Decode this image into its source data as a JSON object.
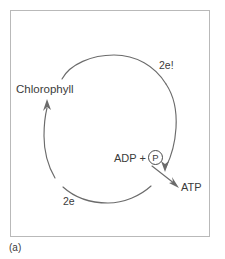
{
  "figure": {
    "caption": "(a)",
    "frame": {
      "border_color": "#b9b9b9",
      "background": "#ffffff"
    },
    "stroke_color": "#6b6b6b",
    "text_color": "#3b3b3b"
  },
  "diagram": {
    "type": "cyclic-photophosphorylation",
    "labels": {
      "chlorophyll": "Chlorophyll",
      "electrons_top": "2e!",
      "electrons_bottom": "2e",
      "adp": "ADP +",
      "phosphate": "P",
      "atp": "ATP"
    },
    "arcs": [
      {
        "name": "top-arc",
        "description": "arc from Chlorophyll upper area sweeping clockwise across the top"
      },
      {
        "name": "right-arc",
        "description": "arc descending on the right past ADP + P"
      },
      {
        "name": "bottom-arc",
        "description": "arc along the bottom flowing right to left"
      },
      {
        "name": "left-arc",
        "description": "arc rising on the left ending in an arrowhead at Chlorophyll"
      }
    ],
    "arrows": [
      {
        "name": "arrow-to-chlorophyll",
        "direction": "up",
        "target": "Chlorophyll"
      },
      {
        "name": "arrow-to-atp",
        "direction": "down-right",
        "source": "ADP + P",
        "target": "ATP"
      }
    ]
  }
}
